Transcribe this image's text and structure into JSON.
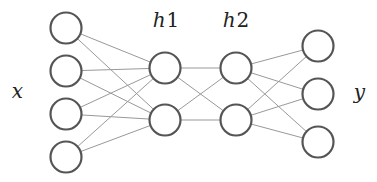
{
  "colors": {
    "background": "#ffffff",
    "node_fill": "#ffffff",
    "node_stroke": "#555555",
    "edge_stroke": "#999999",
    "label_color": "#222222"
  },
  "diagram": {
    "type": "neural-network",
    "canvas": {
      "width": 377,
      "height": 182
    },
    "node_radius": 15.5,
    "node_stroke_width": 2.2,
    "edge_width": 1,
    "connections": "fully-connected-adjacent-layers",
    "layers": [
      {
        "name": "input",
        "x": 66,
        "node_ys": [
          28,
          71,
          114,
          157
        ]
      },
      {
        "name": "h1",
        "x": 165,
        "node_ys": [
          68,
          120
        ]
      },
      {
        "name": "h2",
        "x": 236,
        "node_ys": [
          68,
          120
        ]
      },
      {
        "name": "output",
        "x": 318,
        "node_ys": [
          46,
          94,
          142
        ]
      }
    ],
    "labels": {
      "x": {
        "italic": "x",
        "normal": ""
      },
      "h1": {
        "italic": "h",
        "normal": "1"
      },
      "h2": {
        "italic": "h",
        "normal": "2"
      },
      "y": {
        "italic": "y",
        "normal": ""
      }
    }
  }
}
